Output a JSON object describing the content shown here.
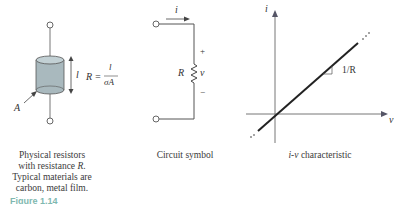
{
  "panels": {
    "physical": {
      "caption_line1": "Physical resistors",
      "caption_line2_prefix": "with resistance ",
      "caption_line2_var": "R",
      "caption_line2_suffix": ".",
      "caption_line3": "Typical materials are",
      "caption_line4": "carbon, metal film.",
      "length_label": "l",
      "area_label": "A",
      "formula_lhs": "R =",
      "formula_num": "l",
      "formula_den": "σA",
      "cylinder_color": "#a9b9be"
    },
    "symbol": {
      "caption": "Circuit symbol",
      "current_label": "i",
      "resistor_label": "R",
      "voltage_label": "v",
      "plus": "+",
      "minus": "−"
    },
    "iv": {
      "caption_var": "i-v",
      "caption_text": " characteristic",
      "y_axis_label": "i",
      "x_axis_label": "v",
      "slope_label": "1/R"
    }
  },
  "figure_caption": "Figure 1.14"
}
